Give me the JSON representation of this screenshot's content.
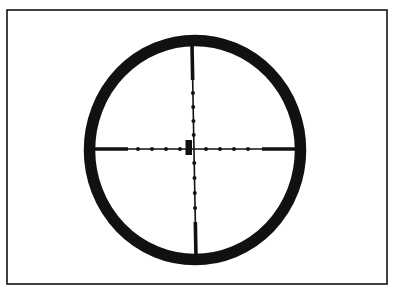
{
  "figure": {
    "type": "scope-reticle",
    "style": "mil-dot",
    "colors": {
      "background": "#ffffff",
      "ink": "#111111"
    },
    "frame": {
      "x": 7,
      "y": 10,
      "width": 380,
      "height": 274,
      "stroke_width": 1.6
    },
    "ring": {
      "cx": 195,
      "cy": 150,
      "rx": 105.5,
      "ry": 109.5,
      "stroke_width": 11.5
    },
    "crosshair": {
      "horizontal": {
        "y": 149,
        "x1": 90,
        "x2": 300,
        "stroke_width": 1.6,
        "thick_segments": [
          [
            95,
            128
          ],
          [
            262,
            296
          ]
        ],
        "thick_width": 3.6,
        "dots_x": [
          138,
          152,
          166,
          180,
          206,
          220,
          234,
          248
        ],
        "dot_r": 2
      },
      "vertical": {
        "x_top": 192,
        "x_bottom": 196,
        "y1": 44,
        "y2": 258,
        "stroke_width": 1.6,
        "thick_segments": [
          [
            46,
            80
          ],
          [
            222,
            254
          ]
        ],
        "thick_width": 3.6,
        "dots_y": [
          93,
          107,
          121,
          135,
          163,
          178,
          193,
          208
        ],
        "dot_r": 2
      },
      "center_mark": {
        "x": 185.5,
        "y": 140,
        "width": 6.5,
        "height": 15
      }
    }
  }
}
